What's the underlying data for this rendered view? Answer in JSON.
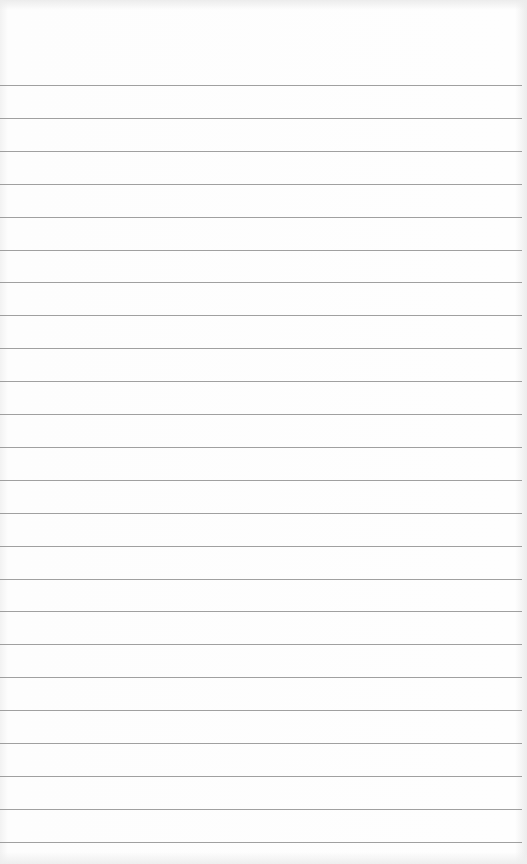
{
  "paper": {
    "type": "ruled-notepaper",
    "background_color": "#fdfdfd",
    "line_color": "#8f8f8f",
    "line_count": 24,
    "first_line_y": 85,
    "line_spacing": 32.9
  }
}
